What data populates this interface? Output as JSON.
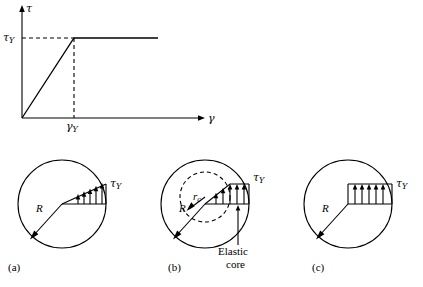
{
  "figure": {
    "title": "",
    "panels": [
      {
        "id": "graph",
        "axis_y_label": "τ",
        "axis_x_label": "γ",
        "y_tick_label": "τY",
        "x_tick_label": "γY",
        "description": "Elastic-perfectly plastic shear stress strain curve"
      },
      {
        "id": "a",
        "caption": "(a)",
        "radius_label": "R",
        "stress_label": "τY",
        "description": "Circular cross section with linear elastic shear stress distribution"
      },
      {
        "id": "b",
        "caption": "(b)",
        "radius_label": "R",
        "core_radius_label": "rc",
        "stress_label": "τY",
        "core_label_line1": "Elastic",
        "core_label_line2": "core",
        "description": "Partially plastic section with elastic core of radius rc"
      },
      {
        "id": "c",
        "caption": "(c)",
        "radius_label": "R",
        "stress_label": "τY",
        "description": "Fully plastic section with uniform shear stress"
      }
    ]
  },
  "colors": {
    "line": "#000000",
    "background": "#ffffff"
  }
}
